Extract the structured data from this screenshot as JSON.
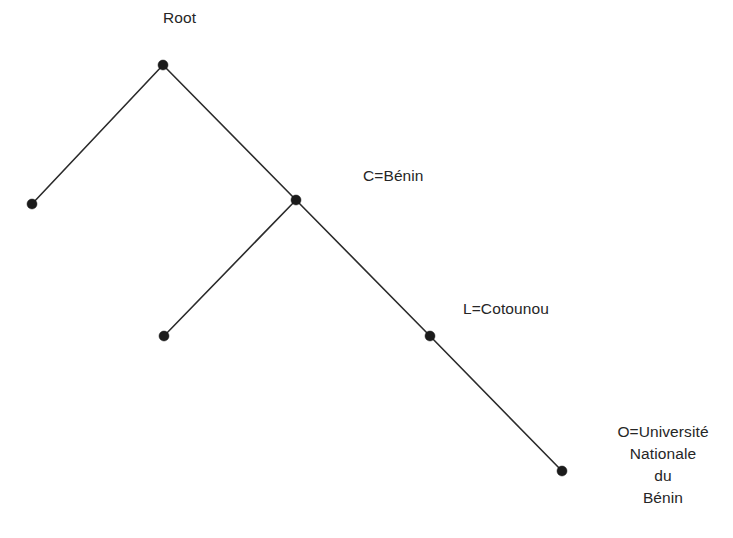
{
  "diagram": {
    "type": "tree",
    "title_label": "Root",
    "background_color": "#ffffff",
    "line_color": "#2b2b2b",
    "node_color": "#1b1b1b",
    "nodes": [
      {
        "id": "root",
        "label": "Root",
        "x": 163,
        "y": 65
      },
      {
        "id": "leaf1",
        "label": "",
        "x": 32,
        "y": 204
      },
      {
        "id": "benin",
        "label": "C=Bénin",
        "x": 296,
        "y": 200
      },
      {
        "id": "leaf2",
        "label": "",
        "x": 164,
        "y": 336
      },
      {
        "id": "cotounou",
        "label": "L=Cotounou",
        "x": 430,
        "y": 336
      },
      {
        "id": "universite",
        "label": "O=Université\nNationale\ndu\nBénin",
        "x": 562,
        "y": 471
      }
    ],
    "edges": [
      {
        "from": "root",
        "to": "leaf1"
      },
      {
        "from": "root",
        "to": "benin"
      },
      {
        "from": "benin",
        "to": "leaf2"
      },
      {
        "from": "benin",
        "to": "cotounou"
      },
      {
        "from": "cotounou",
        "to": "universite"
      }
    ],
    "labels": {
      "root": "Root",
      "benin": "C=Bénin",
      "cotounou": "L=Cotounou",
      "universite": "O=Université\nNationale\ndu\nBénin"
    }
  }
}
